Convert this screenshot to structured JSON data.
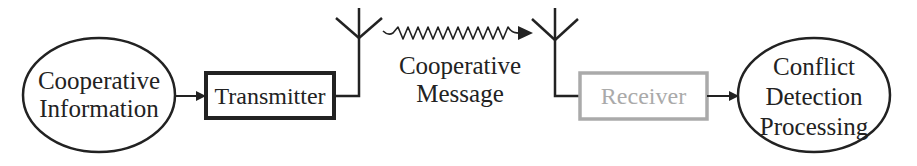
{
  "diagram": {
    "title": "",
    "nodes": {
      "source": {
        "line1": "Cooperative",
        "line2": "Information",
        "shape": "ellipse"
      },
      "transmitter": {
        "label": "Transmitter",
        "shape": "box"
      },
      "message": {
        "line1": "Cooperative",
        "line2": "Message"
      },
      "receiver": {
        "label": "Receiver",
        "shape": "box",
        "state": "grayed"
      },
      "sink": {
        "line1": "Conflict",
        "line2": "Detection",
        "line3": "Processing",
        "shape": "ellipse"
      }
    },
    "icons": [
      "antenna-icon-transmit",
      "wireless-wave-arrow-icon",
      "antenna-icon-receive"
    ],
    "colors": {
      "stroke": "#222222",
      "text": "#222222",
      "receiver_gray": "#aaaaaa",
      "background": "#ffffff"
    }
  }
}
